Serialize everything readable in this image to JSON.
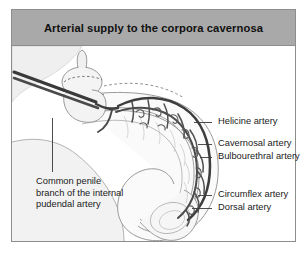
{
  "figure": {
    "title": "Arterial supply to the corpora cavernosa",
    "band_color": "#a9a9a9",
    "border_color": "#8d8d8d",
    "background_color": "#ffffff"
  },
  "labels": {
    "helicine": "Helicine artery",
    "cavernosal": "Cavernosal artery",
    "bulbourethral": "Bulbourethral artery",
    "circumflex": "Circumflex artery",
    "dorsal": "Dorsal artery",
    "common_penile": "Common penile branch of the internal pudendal artery"
  },
  "illustration": {
    "name": "penis-arterial-supply-line-drawing",
    "style": "grayscale-line-art",
    "vessel_color": "#3d3d3d",
    "outline_color": "#6e6e6e",
    "shade_color": "#e8e8e8",
    "leader_color": "#3a3a3a"
  }
}
